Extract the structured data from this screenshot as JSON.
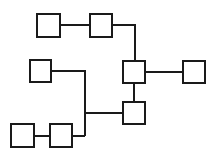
{
  "diagram": {
    "type": "block-tree",
    "stroke_color": "#1a1a1a",
    "background": "#ffffff",
    "nodes": [
      {
        "id": "n1",
        "x": 37,
        "y": 14,
        "w": 23,
        "h": 23
      },
      {
        "id": "n2",
        "x": 90,
        "y": 14,
        "w": 22,
        "h": 23
      },
      {
        "id": "n3",
        "x": 123,
        "y": 61,
        "w": 22,
        "h": 22
      },
      {
        "id": "n4",
        "x": 123,
        "y": 102,
        "w": 22,
        "h": 22
      },
      {
        "id": "n5",
        "x": 183,
        "y": 61,
        "w": 22,
        "h": 22
      },
      {
        "id": "n6",
        "x": 30,
        "y": 60,
        "w": 21,
        "h": 22
      },
      {
        "id": "n7",
        "x": 11,
        "y": 124,
        "w": 23,
        "h": 23
      },
      {
        "id": "n8",
        "x": 50,
        "y": 124,
        "w": 22,
        "h": 23
      }
    ],
    "edges": [
      {
        "from": "n1",
        "to": "n2",
        "points": "60,25 90,25"
      },
      {
        "from": "n2",
        "to": "n3",
        "points": "112,25 135,25 135,61"
      },
      {
        "from": "n3",
        "to": "n5",
        "points": "145,72 183,72"
      },
      {
        "from": "n3",
        "to": "n4",
        "points": "134,83 134,102"
      },
      {
        "from": "n6",
        "to": "trunk",
        "points": "51,71 85,71 85,136"
      },
      {
        "from": "trunk",
        "to": "n4",
        "points": "85,113 123,113"
      },
      {
        "from": "n7",
        "to": "n8",
        "points": "34,136 50,136"
      },
      {
        "from": "n8",
        "to": "trunk",
        "points": "72,136 85,136"
      }
    ]
  }
}
